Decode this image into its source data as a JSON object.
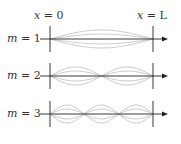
{
  "diagram": {
    "type": "standing-wave-modes",
    "top_labels": [
      {
        "var": "x",
        "eq": " = ",
        "val": "0"
      },
      {
        "var": "x",
        "eq": " = ",
        "val": "L"
      }
    ],
    "modes": [
      {
        "var": "m",
        "eq": " = ",
        "val": "1",
        "n": 1
      },
      {
        "var": "m",
        "eq": " = ",
        "val": "2",
        "n": 2
      },
      {
        "var": "m",
        "eq": " = ",
        "val": "3",
        "n": 3
      }
    ],
    "colors": {
      "axis": "#222222",
      "wave": "#bbbbbb",
      "text": "#333333"
    }
  }
}
